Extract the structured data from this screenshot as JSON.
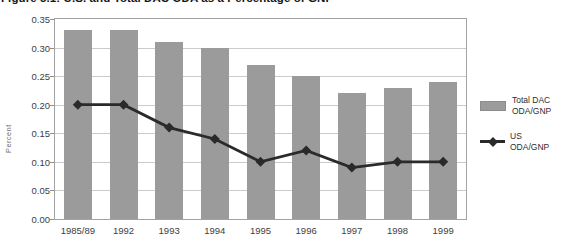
{
  "title": "Figure 5.1: U.S. and Total DAC ODA as a Percentage of GNP",
  "chart_data": {
    "type": "bar",
    "categories": [
      "1985/89",
      "1992",
      "1993",
      "1994",
      "1995",
      "1996",
      "1997",
      "1998",
      "1999"
    ],
    "series": [
      {
        "name": "Total DAC ODA/GNP",
        "render": "bar",
        "color": "#9b9b9b",
        "values": [
          0.33,
          0.33,
          0.31,
          0.3,
          0.27,
          0.25,
          0.22,
          0.23,
          0.24
        ]
      },
      {
        "name": "US ODA/GNP",
        "render": "line",
        "color": "#2a2a2a",
        "marker": "diamond",
        "values": [
          0.2,
          0.2,
          0.16,
          0.14,
          0.1,
          0.12,
          0.09,
          0.1,
          0.1
        ]
      }
    ],
    "xlabel": "",
    "ylabel": "Percent",
    "ylim": [
      0,
      0.35
    ],
    "ytick_step": 0.05,
    "ytick_format_decimals": 2,
    "grid": true,
    "legend_position": "right"
  },
  "legend": {
    "items": [
      {
        "label": "Total DAC\nODA/GNP",
        "swatch": "bar-swatch"
      },
      {
        "label": "US\nODA/GNP",
        "swatch": "line-diamond-swatch"
      }
    ]
  },
  "colors": {
    "bar_fill": "#9b9b9b",
    "line": "#2a2a2a",
    "gridline": "#cbcbcb",
    "frame": "#a3a3a3",
    "text": "#3e3e3e"
  }
}
